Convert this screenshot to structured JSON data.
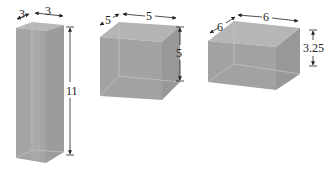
{
  "figure": {
    "colors": {
      "top_face": "#b4b4b4",
      "front_face": "#9e9e9e",
      "side_face": "#a8a8a8",
      "edge_light": "#c6c6c6",
      "dimension_line": "#222222"
    },
    "boxes": [
      {
        "name": "tall-box",
        "depth_label": "3",
        "width_label": "3",
        "height_label": "11"
      },
      {
        "name": "cube",
        "depth_label": "5",
        "width_label": "5",
        "height_label": "5"
      },
      {
        "name": "short-box",
        "depth_label": "6",
        "width_label": "6",
        "height_label": "3.25"
      }
    ]
  }
}
